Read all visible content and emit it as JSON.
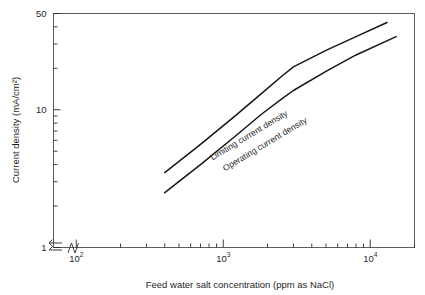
{
  "chart_data": {
    "type": "line",
    "title": "",
    "xlabel": "Feed water salt concentration (ppm as NaCl)",
    "ylabel": "Current density (mA/cm²)",
    "xscale": "log",
    "yscale": "log",
    "xlim": [
      70,
      20000
    ],
    "ylim": [
      1,
      50
    ],
    "grid": false,
    "legend": "inline-curve-labels",
    "axis_break": {
      "x_axis": true,
      "y_axis": true,
      "note": "zigzag break marks near origin on both axes"
    },
    "xticks": [
      {
        "value": 100,
        "label": "10",
        "exponent": "2",
        "major": true
      },
      {
        "value": 1000,
        "label": "10",
        "exponent": "3",
        "major": true
      },
      {
        "value": 10000,
        "label": "10",
        "exponent": "4",
        "major": true
      }
    ],
    "xminor_ticks": [
      200,
      300,
      400,
      500,
      600,
      700,
      800,
      900,
      2000,
      3000,
      4000,
      5000,
      6000,
      7000,
      8000,
      9000,
      20000
    ],
    "yticks": [
      {
        "value": 1,
        "label": "1",
        "major": true
      },
      {
        "value": 10,
        "label": "10",
        "major": true
      },
      {
        "value": 50,
        "label": "50",
        "major": true
      }
    ],
    "yminor_ticks": [
      2,
      3,
      4,
      5,
      6,
      7,
      8,
      9,
      20,
      30,
      40
    ],
    "series": [
      {
        "name": "Limiting current density",
        "label": "Limiting current density",
        "label_rotation_deg": -31,
        "color": "#161616",
        "points": [
          {
            "x": 400,
            "y": 3.5
          },
          {
            "x": 700,
            "y": 5.6
          },
          {
            "x": 1200,
            "y": 9.0
          },
          {
            "x": 1800,
            "y": 13.0
          },
          {
            "x": 2500,
            "y": 17.5
          },
          {
            "x": 3000,
            "y": 20.5
          },
          {
            "x": 5000,
            "y": 27.0
          },
          {
            "x": 8000,
            "y": 34.0
          },
          {
            "x": 13000,
            "y": 43.0
          }
        ]
      },
      {
        "name": "Operating current density",
        "label": "Operating current density",
        "label_rotation_deg": -31,
        "color": "#161616",
        "points": [
          {
            "x": 400,
            "y": 2.5
          },
          {
            "x": 700,
            "y": 4.0
          },
          {
            "x": 1200,
            "y": 6.4
          },
          {
            "x": 1800,
            "y": 9.2
          },
          {
            "x": 2500,
            "y": 12.0
          },
          {
            "x": 3000,
            "y": 13.8
          },
          {
            "x": 5000,
            "y": 19.0
          },
          {
            "x": 8000,
            "y": 25.0
          },
          {
            "x": 15000,
            "y": 34.0
          }
        ]
      }
    ]
  }
}
